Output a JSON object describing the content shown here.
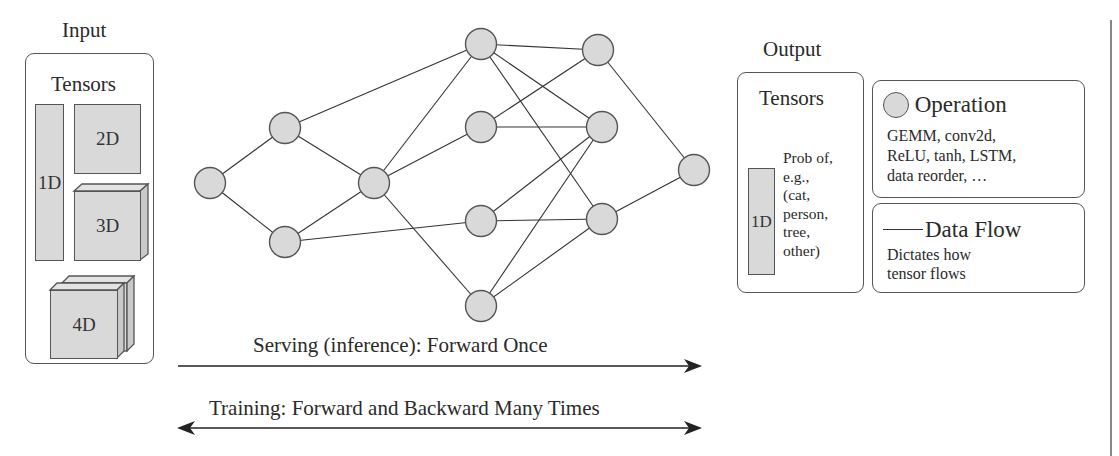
{
  "input": {
    "title": "Input",
    "box_title": "Tensors",
    "tensors": [
      {
        "label": "1D",
        "shape": "bar"
      },
      {
        "label": "2D",
        "shape": "square"
      },
      {
        "label": "3D",
        "shape": "cube"
      },
      {
        "label": "4D",
        "shape": "stacked-cubes"
      }
    ]
  },
  "network": {
    "nodes": [
      {
        "id": "n1",
        "x": 210,
        "y": 183
      },
      {
        "id": "n2",
        "x": 285,
        "y": 128
      },
      {
        "id": "n3",
        "x": 285,
        "y": 242
      },
      {
        "id": "n4",
        "x": 374,
        "y": 183
      },
      {
        "id": "l3a",
        "x": 481,
        "y": 44
      },
      {
        "id": "l3b",
        "x": 481,
        "y": 127
      },
      {
        "id": "l3c",
        "x": 481,
        "y": 221
      },
      {
        "id": "l3d",
        "x": 481,
        "y": 306
      },
      {
        "id": "l4a",
        "x": 598,
        "y": 50
      },
      {
        "id": "l4b",
        "x": 602,
        "y": 127
      },
      {
        "id": "l4c",
        "x": 602,
        "y": 219
      },
      {
        "id": "out",
        "x": 694,
        "y": 170
      }
    ],
    "edges": [
      [
        "n1",
        "n2"
      ],
      [
        "n1",
        "n3"
      ],
      [
        "n2",
        "n4"
      ],
      [
        "n3",
        "n4"
      ],
      [
        "n2",
        "l3a"
      ],
      [
        "n3",
        "l3c"
      ],
      [
        "n4",
        "l3a"
      ],
      [
        "n4",
        "l3b"
      ],
      [
        "n4",
        "l3d"
      ],
      [
        "l3a",
        "l4a"
      ],
      [
        "l3a",
        "l4b"
      ],
      [
        "l3a",
        "l4c"
      ],
      [
        "l3b",
        "l4a"
      ],
      [
        "l3b",
        "l4b"
      ],
      [
        "l3c",
        "l4b"
      ],
      [
        "l3c",
        "l4c"
      ],
      [
        "l3d",
        "l4b"
      ],
      [
        "l3d",
        "l4c"
      ],
      [
        "l4a",
        "out"
      ],
      [
        "l4c",
        "out"
      ]
    ],
    "node_fill": "#d9d9d9",
    "node_stroke": "#555555"
  },
  "arrows": {
    "serving": "Serving (inference): Forward Once",
    "training": "Training: Forward and Backward Many Times"
  },
  "output": {
    "title": "Output",
    "box_title": "Tensors",
    "tensor_label": "1D",
    "description_lines": [
      "Prob of,",
      "e.g.,",
      "(cat,",
      "person,",
      "tree,",
      "other)"
    ]
  },
  "legend": {
    "operation": {
      "title": "Operation",
      "lines": [
        "GEMM, conv2d,",
        "ReLU, tanh, LSTM,",
        "data reorder, …"
      ]
    },
    "data_flow": {
      "title": "Data Flow",
      "lines": [
        "Dictates how",
        "tensor flows"
      ]
    }
  }
}
